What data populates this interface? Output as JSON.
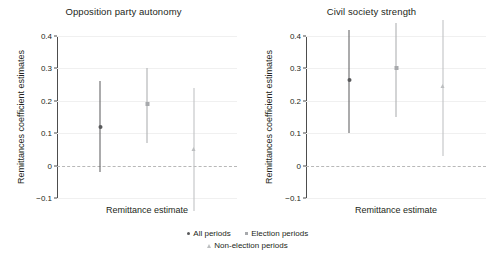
{
  "figure": {
    "background": "#ffffff",
    "text_color": "#231f20"
  },
  "legend": {
    "position": "bottom-center",
    "entries": [
      {
        "label": "All periods",
        "marker": "circle",
        "color": "#58595b"
      },
      {
        "label": "Election periods",
        "marker": "square",
        "color": "#a7a9ac"
      },
      {
        "label": "Non-election periods",
        "marker": "triangle",
        "color": "#bcbec0"
      }
    ]
  },
  "chart_data": [
    {
      "type": "scatter",
      "title": "Opposition party autonomy",
      "xlabel": "Remittance estimate",
      "ylabel": "Remittances coefficient estimates",
      "ylim": [
        -0.1,
        0.4
      ],
      "yticks": [
        "0.4",
        "0.3",
        "0.2",
        "0.1",
        "0",
        "-0.1"
      ],
      "ytick_values": [
        0.4,
        0.3,
        0.2,
        0.1,
        0,
        -0.1
      ],
      "grid": true,
      "zero_reference_line": 0,
      "series": [
        {
          "name": "All periods",
          "marker": "circle",
          "color": "#58595b",
          "estimate": 0.12,
          "ci_low": -0.02,
          "ci_high": 0.26
        },
        {
          "name": "Election periods",
          "marker": "square",
          "color": "#a7a9ac",
          "estimate": 0.19,
          "ci_low": 0.07,
          "ci_high": 0.3
        },
        {
          "name": "Non-election periods",
          "marker": "triangle",
          "color": "#bcbec0",
          "estimate": 0.05,
          "ci_low": -0.14,
          "ci_high": 0.24
        }
      ]
    },
    {
      "type": "scatter",
      "title": "Civil society strength",
      "xlabel": "Remittance estimate",
      "ylabel": "Remittances coefficient estimates",
      "ylim": [
        -0.1,
        0.4
      ],
      "yticks": [
        "0.4",
        "0.3",
        "0.2",
        "0.1",
        "0",
        "-0.1"
      ],
      "ytick_values": [
        0.4,
        0.3,
        0.2,
        0.1,
        0,
        -0.1
      ],
      "grid": true,
      "zero_reference_line": 0,
      "series": [
        {
          "name": "All periods",
          "marker": "circle",
          "color": "#58595b",
          "estimate": 0.265,
          "ci_low": 0.1,
          "ci_high": 0.42
        },
        {
          "name": "Election periods",
          "marker": "square",
          "color": "#a7a9ac",
          "estimate": 0.3,
          "ci_low": 0.15,
          "ci_high": 0.44
        },
        {
          "name": "Non-election periods",
          "marker": "triangle",
          "color": "#bcbec0",
          "estimate": 0.245,
          "ci_low": 0.03,
          "ci_high": 0.45
        }
      ]
    }
  ]
}
